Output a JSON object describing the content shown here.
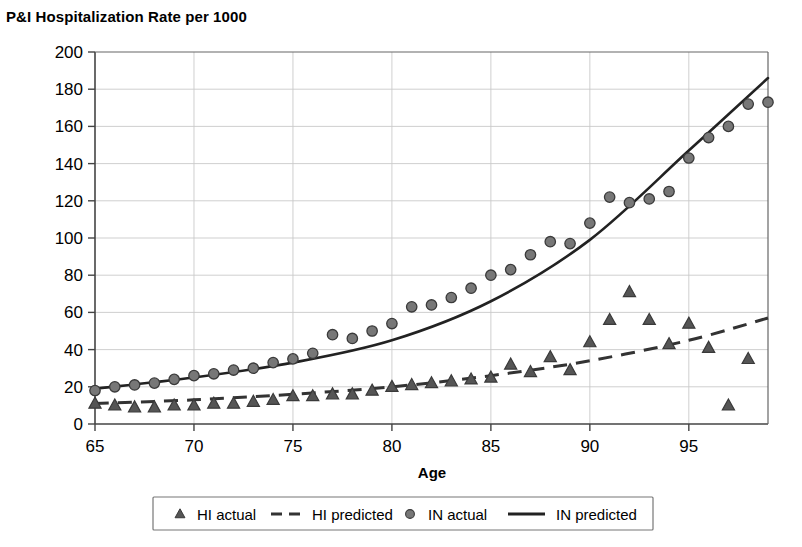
{
  "chart_data": {
    "type": "scatter",
    "title": "P&I Hospitalization Rate per 1000",
    "xlabel": "Age",
    "ylabel": "",
    "xlim": [
      65,
      99
    ],
    "ylim": [
      0,
      200
    ],
    "x_ticks": [
      65,
      70,
      75,
      80,
      85,
      90,
      95
    ],
    "x_tick_labels": [
      "65",
      "70",
      "75",
      "80",
      "85",
      "90",
      "95"
    ],
    "y_ticks": [
      0,
      20,
      40,
      60,
      80,
      100,
      120,
      140,
      160,
      180,
      200
    ],
    "y_tick_labels": [
      "0",
      "20",
      "40",
      "60",
      "80",
      "100",
      "120",
      "140",
      "160",
      "180",
      "200"
    ],
    "grid": true,
    "grid_axis": "both",
    "legend_position": "bottom",
    "series": [
      {
        "name": "HI actual",
        "marker": "triangle",
        "style": "markers",
        "color": "#555555",
        "x": [
          65,
          66,
          67,
          68,
          69,
          70,
          71,
          72,
          73,
          74,
          75,
          76,
          77,
          78,
          79,
          80,
          81,
          82,
          83,
          84,
          85,
          86,
          87,
          88,
          89,
          90,
          91,
          92,
          93,
          94,
          95,
          96,
          97,
          98
        ],
        "values": [
          11,
          10,
          9,
          9,
          10,
          10,
          11,
          11,
          12,
          13,
          15,
          15,
          16,
          16,
          18,
          20,
          21,
          22,
          23,
          24,
          25,
          32,
          28,
          36,
          29,
          44,
          56,
          71,
          56,
          43,
          54,
          41,
          10,
          35
        ]
      },
      {
        "name": "HI predicted",
        "marker": "none",
        "style": "dashed-line",
        "color": "#333333",
        "x": [
          65,
          70,
          75,
          80,
          85,
          90,
          95,
          99
        ],
        "values": [
          11,
          13,
          16,
          20,
          26,
          34,
          45,
          57
        ]
      },
      {
        "name": "IN actual",
        "marker": "circle",
        "style": "markers",
        "color": "#777777",
        "x": [
          65,
          66,
          67,
          68,
          69,
          70,
          71,
          72,
          73,
          74,
          75,
          76,
          77,
          78,
          79,
          80,
          81,
          82,
          83,
          84,
          85,
          86,
          87,
          88,
          89,
          90,
          91,
          92,
          93,
          94,
          95,
          96,
          97,
          98,
          99
        ],
        "values": [
          18,
          20,
          21,
          22,
          24,
          26,
          27,
          29,
          30,
          33,
          35,
          38,
          48,
          46,
          50,
          54,
          63,
          64,
          68,
          73,
          80,
          83,
          91,
          98,
          97,
          108,
          122,
          119,
          121,
          125,
          143,
          154,
          160,
          172,
          173
        ]
      },
      {
        "name": "IN predicted",
        "marker": "none",
        "style": "solid-line",
        "color": "#222222",
        "x": [
          65,
          70,
          75,
          80,
          85,
          90,
          95,
          99
        ],
        "values": [
          19,
          25,
          33,
          45,
          66,
          99,
          147,
          186
        ]
      }
    ]
  },
  "legend": {
    "items": [
      {
        "label": "HI actual",
        "marker": "triangle-marker-icon"
      },
      {
        "label": "HI predicted",
        "marker": "dashed-line-icon"
      },
      {
        "label": "IN actual",
        "marker": "circle-marker-icon"
      },
      {
        "label": "IN predicted",
        "marker": "solid-line-icon"
      }
    ]
  }
}
